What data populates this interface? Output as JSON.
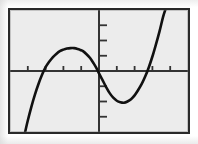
{
  "figure": {
    "name": "graphing-calculator-plot",
    "background_color": "#ececec",
    "border_color": "#2a2a2a",
    "curve_color": "#111111",
    "axis_color": "#333333",
    "page_background": "#ffffff"
  },
  "chart_data": {
    "type": "line",
    "title": "",
    "subtitle": "",
    "xlabel": "",
    "ylabel": "",
    "grid": false,
    "legend": null,
    "legend_position": "none",
    "xlim": [
      -5,
      5
    ],
    "ylim": [
      -4,
      4
    ],
    "xticks": [
      -4,
      -3,
      -2,
      -1,
      1,
      2,
      3,
      4
    ],
    "yticks": [
      -3,
      -2,
      -1,
      1,
      2,
      3
    ],
    "xtick_labels": [
      "",
      "",
      "",
      "",
      "",
      "",
      "",
      ""
    ],
    "ytick_labels": [
      "",
      "",
      "",
      "",
      "",
      ""
    ],
    "axis_origin": [
      0,
      0
    ],
    "features": {
      "x_intercepts": [
        -3.3,
        -1.65,
        1.95
      ],
      "y_intercept": -0.9,
      "local_maximum": [
        -1.05,
        1.05
      ],
      "local_minimum": [
        0.95,
        -1.9
      ]
    },
    "series": [
      {
        "name": "cubic",
        "color": "#111111",
        "points": [
          [
            -4.15,
            -4.0
          ],
          [
            -4.0,
            -3.25
          ],
          [
            -3.8,
            -2.35
          ],
          [
            -3.6,
            -1.55
          ],
          [
            -3.4,
            -0.85
          ],
          [
            -3.2,
            -0.25
          ],
          [
            -3.0,
            0.25
          ],
          [
            -2.8,
            0.6
          ],
          [
            -2.6,
            0.9
          ],
          [
            -2.4,
            1.12
          ],
          [
            -2.2,
            1.3
          ],
          [
            -2.0,
            1.4
          ],
          [
            -1.8,
            1.47
          ],
          [
            -1.6,
            1.5
          ],
          [
            -1.4,
            1.5
          ],
          [
            -1.2,
            1.45
          ],
          [
            -1.05,
            1.38
          ],
          [
            -0.9,
            1.3
          ],
          [
            -0.7,
            1.1
          ],
          [
            -0.5,
            0.85
          ],
          [
            -0.3,
            0.5
          ],
          [
            -0.15,
            0.2
          ],
          [
            0.0,
            -0.15
          ],
          [
            0.2,
            -0.6
          ],
          [
            0.4,
            -1.05
          ],
          [
            0.6,
            -1.45
          ],
          [
            0.8,
            -1.75
          ],
          [
            1.0,
            -1.95
          ],
          [
            1.2,
            -2.05
          ],
          [
            1.4,
            -2.08
          ],
          [
            1.6,
            -2.0
          ],
          [
            1.8,
            -1.85
          ],
          [
            2.0,
            -1.6
          ],
          [
            2.2,
            -1.25
          ],
          [
            2.4,
            -0.85
          ],
          [
            2.6,
            -0.35
          ],
          [
            2.8,
            0.25
          ],
          [
            3.0,
            0.95
          ],
          [
            3.2,
            1.75
          ],
          [
            3.4,
            2.6
          ],
          [
            3.6,
            3.55
          ],
          [
            3.72,
            4.0
          ]
        ]
      }
    ]
  }
}
